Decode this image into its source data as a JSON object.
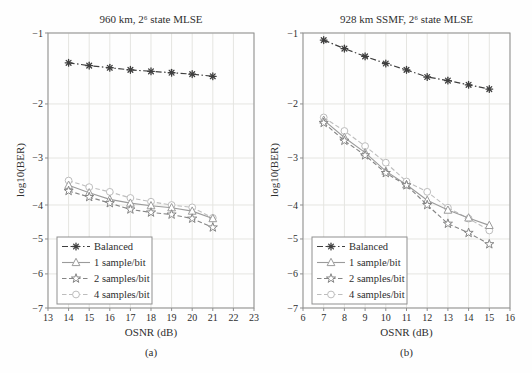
{
  "colors": {
    "background": "#fefefe",
    "frame": "#8f8f8f",
    "grid": "#e5e5e1",
    "text": "#2e2e2e",
    "balanced": "#3f3f3f",
    "one_sample": "#9b9b9b",
    "two_samples": "#858585",
    "four_samples": "#bdbdbd"
  },
  "chart_data": [
    {
      "type": "line",
      "title": "960 km, 2⁶ state MLSE",
      "xlabel": "OSNR (dB)",
      "ylabel": "log10(BER)",
      "sublabel": "(a)",
      "grid": true,
      "legend_position": "lower-left",
      "xlim": [
        13,
        23
      ],
      "ylim": [
        -7,
        -1
      ],
      "x_ticks": [
        13,
        14,
        15,
        16,
        17,
        18,
        19,
        20,
        21,
        22,
        23
      ],
      "y_ticks": [
        -1,
        -2,
        -3,
        -4,
        -5,
        -6,
        -7
      ],
      "y_tick_fractions": [
        0,
        0.258,
        0.4545,
        0.6255,
        0.749,
        0.876,
        1
      ],
      "x": [
        14,
        15,
        16,
        17,
        18,
        19,
        20,
        21
      ],
      "series": [
        {
          "name": "Balanced",
          "marker": "asterisk",
          "line": "dashdot",
          "color": "#3f3f3f",
          "values": [
            -1.42,
            -1.46,
            -1.49,
            -1.52,
            -1.54,
            -1.56,
            -1.58,
            -1.61
          ]
        },
        {
          "name": "1 sample/bit",
          "marker": "triangle",
          "line": "solid",
          "color": "#9b9b9b",
          "values": [
            -3.58,
            -3.74,
            -3.88,
            -3.96,
            -4.02,
            -4.08,
            -4.18,
            -4.4
          ]
        },
        {
          "name": "2 samples/bit",
          "marker": "star",
          "line": "dashed",
          "color": "#858585",
          "values": [
            -3.7,
            -3.83,
            -3.96,
            -4.13,
            -4.22,
            -4.28,
            -4.4,
            -4.66
          ]
        },
        {
          "name": "4 samples/bit",
          "marker": "circle",
          "line": "dashed",
          "color": "#bdbdbd",
          "values": [
            -3.48,
            -3.62,
            -3.72,
            -3.85,
            -3.93,
            -4.0,
            -4.07,
            -4.38
          ]
        }
      ]
    },
    {
      "type": "line",
      "title": "928 km SSMF, 2⁶ state MLSE",
      "xlabel": "OSNR (dB)",
      "ylabel": "log10(BER)",
      "sublabel": "(b)",
      "grid": true,
      "legend_position": "lower-left",
      "xlim": [
        6,
        16
      ],
      "ylim": [
        -7,
        -1
      ],
      "x_ticks": [
        6,
        7,
        8,
        9,
        10,
        11,
        12,
        13,
        14,
        15,
        16
      ],
      "y_ticks": [
        -1,
        -2,
        -3,
        -4,
        -5,
        -6,
        -7
      ],
      "y_tick_fractions": [
        0,
        0.258,
        0.4545,
        0.6255,
        0.749,
        0.876,
        1
      ],
      "x": [
        7,
        8,
        9,
        10,
        11,
        12,
        13,
        14,
        15
      ],
      "series": [
        {
          "name": "Balanced",
          "marker": "asterisk",
          "line": "dashdot",
          "color": "#3f3f3f",
          "values": [
            -1.1,
            -1.22,
            -1.33,
            -1.43,
            -1.52,
            -1.62,
            -1.67,
            -1.73,
            -1.79
          ]
        },
        {
          "name": "1 sample/bit",
          "marker": "triangle",
          "line": "solid",
          "color": "#9b9b9b",
          "values": [
            -2.3,
            -2.62,
            -2.9,
            -3.28,
            -3.57,
            -3.9,
            -4.15,
            -4.38,
            -4.6
          ]
        },
        {
          "name": "2 samples/bit",
          "marker": "star",
          "line": "dashed",
          "color": "#858585",
          "values": [
            -2.35,
            -2.68,
            -2.95,
            -3.32,
            -3.58,
            -4.0,
            -4.55,
            -4.82,
            -5.15
          ]
        },
        {
          "name": "4 samples/bit",
          "marker": "circle",
          "line": "dashed",
          "color": "#bdbdbd",
          "values": [
            -2.25,
            -2.5,
            -2.78,
            -3.1,
            -3.5,
            -3.72,
            -4.08,
            -4.4,
            -4.75
          ]
        }
      ]
    }
  ]
}
